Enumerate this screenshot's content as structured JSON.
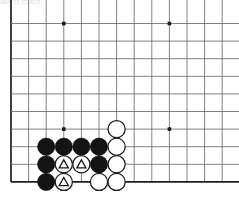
{
  "diagram": {
    "kind": "go-board-problem-diagram",
    "caption_strip": "図4    白先黒死",
    "board": {
      "grid_color": "#6d6d72",
      "edge_color": "#1d1d1f",
      "background_color": "#ffffff",
      "origin_x": 11,
      "origin_y": 23.5,
      "spacing": 17.6,
      "columns_visible": 13,
      "rows_visible": 10,
      "left_edge": true,
      "bottom_edge": true,
      "top_edge": false,
      "right_edge": false,
      "star_points": [
        {
          "col": 4,
          "row": 1
        },
        {
          "col": 10,
          "row": 1
        },
        {
          "col": 4,
          "row": 7
        },
        {
          "col": 10,
          "row": 7
        }
      ]
    },
    "stones": [
      {
        "col": 3,
        "row": 8,
        "color": "black",
        "marker": "none",
        "label": "black-stone"
      },
      {
        "col": 4,
        "row": 8,
        "color": "black",
        "marker": "none",
        "label": "black-stone"
      },
      {
        "col": 5,
        "row": 8,
        "color": "black",
        "marker": "none",
        "label": "black-stone"
      },
      {
        "col": 6,
        "row": 8,
        "color": "black",
        "marker": "none",
        "label": "black-stone"
      },
      {
        "col": 7,
        "row": 7,
        "color": "white",
        "marker": "none",
        "label": "white-stone"
      },
      {
        "col": 7,
        "row": 8,
        "color": "white",
        "marker": "none",
        "label": "white-stone"
      },
      {
        "col": 3,
        "row": 9,
        "color": "black",
        "marker": "none",
        "label": "black-stone"
      },
      {
        "col": 4,
        "row": 9,
        "color": "white",
        "marker": "triangle",
        "label": "white-stone-triangle"
      },
      {
        "col": 5,
        "row": 9,
        "color": "white",
        "marker": "triangle",
        "label": "white-stone-triangle"
      },
      {
        "col": 6,
        "row": 9,
        "color": "black",
        "marker": "none",
        "label": "black-stone"
      },
      {
        "col": 7,
        "row": 9,
        "color": "white",
        "marker": "none",
        "label": "white-stone"
      },
      {
        "col": 3,
        "row": 10,
        "color": "black",
        "marker": "none",
        "label": "black-stone"
      },
      {
        "col": 4,
        "row": 10,
        "color": "white",
        "marker": "triangle",
        "label": "white-stone-triangle"
      },
      {
        "col": 6,
        "row": 10,
        "color": "white",
        "marker": "none",
        "label": "white-stone"
      },
      {
        "col": 7,
        "row": 10,
        "color": "white",
        "marker": "none",
        "label": "white-stone"
      }
    ],
    "stone_radius": 8.6,
    "marker_triangle_size": 9.2,
    "counts": {
      "black_stones": 7,
      "white_stones": 8,
      "triangle_markers": 3
    }
  }
}
